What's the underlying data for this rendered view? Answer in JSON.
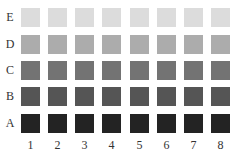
{
  "rows": [
    {
      "label": "E",
      "color": "#dcdcdc"
    },
    {
      "label": "D",
      "color": "#acacac"
    },
    {
      "label": "C",
      "color": "#737373"
    },
    {
      "label": "B",
      "color": "#555555"
    },
    {
      "label": "A",
      "color": "#232323"
    }
  ],
  "columns": [
    "1",
    "2",
    "3",
    "4",
    "5",
    "6",
    "7",
    "8"
  ]
}
